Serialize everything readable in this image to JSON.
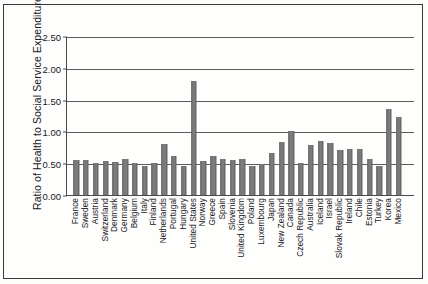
{
  "figure": {
    "name": "ratio-health-social-service-expenditures-bar-chart",
    "background_color": "#fdfdfb",
    "frame_color": "#3a3a3a"
  },
  "chart_data": {
    "type": "bar",
    "title": "",
    "xlabel": "",
    "ylabel": "Ratio of Health to Social Service Expenditures",
    "ylim": [
      0.0,
      2.5
    ],
    "yticks": [
      0.0,
      0.5,
      1.0,
      1.5,
      2.0,
      2.5
    ],
    "ytick_labels": [
      "0.00",
      "0.50",
      "1.00",
      "1.50",
      "2.00",
      "2.50"
    ],
    "grid": true,
    "grid_axis": "y",
    "legend": null,
    "bar_color": "#7b7b7b",
    "categories": [
      "France",
      "Sweden",
      "Austria",
      "Switzerland",
      "Denmark",
      "Germany",
      "Belgium",
      "Italy",
      "Finland",
      "Netherlands",
      "Portugal",
      "Hungary",
      "United States",
      "Norway",
      "Greece",
      "Spain",
      "Slovenia",
      "United Kingdom",
      "Poland",
      "Luxembourg",
      "Japan",
      "New Zealand",
      "Canada",
      "Czech Republic",
      "Australia",
      "Iceland",
      "Israel",
      "Slovak Republic",
      "Ireland",
      "Chile",
      "Estonia",
      "Turkey",
      "Korea",
      "Mexico"
    ],
    "values": [
      0.55,
      0.55,
      0.51,
      0.54,
      0.52,
      0.57,
      0.51,
      0.45,
      0.5,
      0.8,
      0.62,
      0.45,
      1.8,
      0.53,
      0.61,
      0.57,
      0.55,
      0.57,
      0.46,
      0.48,
      0.66,
      0.83,
      1.01,
      0.5,
      0.79,
      0.85,
      0.82,
      0.7,
      0.73,
      0.73,
      0.57,
      0.45,
      1.36,
      1.23
    ]
  }
}
